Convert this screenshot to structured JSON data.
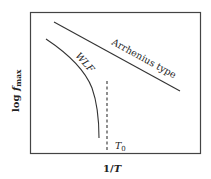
{
  "diagram": {
    "x_axis_label_main": "1/",
    "x_axis_label_var": "T",
    "y_axis_label_prefix": "log ",
    "y_axis_label_var": "f",
    "y_axis_label_sub": "max",
    "curves": [
      {
        "name": "Arrhenius type",
        "label": "Arrhenius type",
        "style": "solid",
        "shape": "straight line"
      },
      {
        "name": "WLF",
        "label": "WLF",
        "style": "solid",
        "shape": "curve bending down"
      }
    ],
    "reference_line": {
      "label_var": "T",
      "label_sub": "0",
      "style": "dashed",
      "orientation": "vertical"
    },
    "colors": {
      "line": "#333333",
      "frame": "#444444",
      "text": "#222222"
    }
  }
}
